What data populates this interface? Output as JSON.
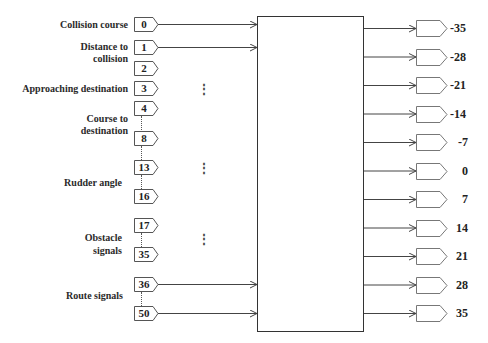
{
  "diagram": {
    "type": "neural-network-input-output-block",
    "input_groups": [
      {
        "label": "Collision course",
        "nodes": [
          "0"
        ]
      },
      {
        "label": "Distance to collision",
        "nodes": [
          "1",
          "2"
        ]
      },
      {
        "label": "Approaching destination",
        "nodes": [
          "3"
        ]
      },
      {
        "label": "Course to destination",
        "nodes": [
          "4",
          "8"
        ]
      },
      {
        "label": "Rudder angle",
        "nodes": [
          "13",
          "16"
        ]
      },
      {
        "label": "Obstacle signals",
        "nodes": [
          "17",
          "35"
        ]
      },
      {
        "label": "Route signals",
        "nodes": [
          "36",
          "50"
        ]
      }
    ],
    "labels": {
      "collision_course": "Collision course",
      "distance_line1": "Distance to",
      "distance_line2": "collision",
      "approaching": "Approaching destination",
      "course_line1": "Course to",
      "course_line2": "destination",
      "rudder": "Rudder angle",
      "obstacle_line1": "Obstacle",
      "obstacle_line2": "signals",
      "route": "Route signals"
    },
    "inputs": [
      "0",
      "1",
      "2",
      "3",
      "4",
      "8",
      "13",
      "16",
      "17",
      "35",
      "36",
      "50"
    ],
    "connected_inputs": [
      "0",
      "1",
      "36",
      "50"
    ],
    "ellipsis": "⋮",
    "outputs": [
      "-35",
      "-28",
      "-21",
      "-14",
      "-7",
      "0",
      "7",
      "14",
      "21",
      "28",
      "35"
    ],
    "colors": {
      "line": "#333333",
      "box": "#555555",
      "background": "#ffffff"
    }
  }
}
